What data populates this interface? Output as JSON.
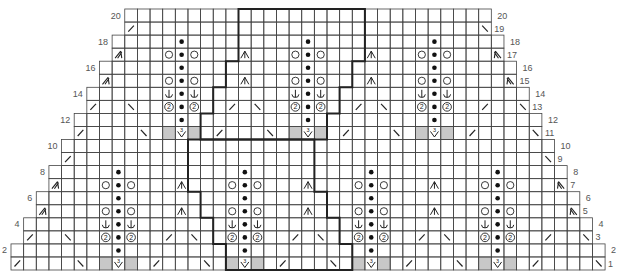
{
  "chart": {
    "columns": 47,
    "rows": 20,
    "shading_color": "#c8c8c8",
    "grid_color": "#444444",
    "outline_color": "#222222",
    "row_shape": "Each pair of rows (1-2, 3-4, ... 19-20) loses one stitch at each edge; rows 1-2 span columns 0-46, rows 19-20 span columns 9-37",
    "left_labels": [
      "2",
      "4",
      "6",
      "8",
      "10",
      "12",
      "14",
      "16",
      "18",
      "20"
    ],
    "right_labels": [
      "1",
      "2",
      "3",
      "4",
      "5",
      "6",
      "7",
      "8",
      "9",
      "10",
      "11",
      "12",
      "13",
      "14",
      "15",
      "16",
      "17",
      "18",
      "19",
      "20"
    ],
    "symbols": {
      "k2tog": "/",
      "ssk": "\\",
      "purl": "dot",
      "yo": "circle",
      "twist2": "circled-2",
      "anchor": "anchor",
      "dec3": "inverted-v-with-stem",
      "inc3": "v-with-3",
      "edge_dec_left": "double-slash-arrow-left",
      "edge_dec_right": "double-slash-arrow-right",
      "no_stitch": "gray"
    },
    "motif_lower_centers": [
      8,
      18,
      28,
      38
    ],
    "motif_upper_centers": [
      13,
      23,
      33
    ],
    "cells": [
      {
        "row": 1,
        "col": 0,
        "sym": "k2tog"
      },
      {
        "row": 1,
        "col": 5,
        "sym": "ssk"
      },
      {
        "row": 1,
        "col": 11,
        "sym": "k2tog"
      },
      {
        "row": 1,
        "col": 15,
        "sym": "ssk"
      },
      {
        "row": 1,
        "col": 21,
        "sym": "k2tog"
      },
      {
        "row": 1,
        "col": 25,
        "sym": "ssk"
      },
      {
        "row": 1,
        "col": 31,
        "sym": "k2tog"
      },
      {
        "row": 1,
        "col": 35,
        "sym": "ssk"
      },
      {
        "row": 1,
        "col": 41,
        "sym": "k2tog"
      },
      {
        "row": 1,
        "col": 46,
        "sym": "ssk"
      },
      {
        "row": 3,
        "col": 1,
        "sym": "k2tog"
      },
      {
        "row": 3,
        "col": 4,
        "sym": "ssk"
      },
      {
        "row": 3,
        "col": 12,
        "sym": "k2tog"
      },
      {
        "row": 3,
        "col": 14,
        "sym": "ssk"
      },
      {
        "row": 3,
        "col": 22,
        "sym": "k2tog"
      },
      {
        "row": 3,
        "col": 24,
        "sym": "ssk"
      },
      {
        "row": 3,
        "col": 32,
        "sym": "k2tog"
      },
      {
        "row": 3,
        "col": 34,
        "sym": "ssk"
      },
      {
        "row": 3,
        "col": 42,
        "sym": "k2tog"
      },
      {
        "row": 3,
        "col": 45,
        "sym": "ssk"
      },
      {
        "row": 5,
        "col": 2,
        "sym": "edge_dec_left"
      },
      {
        "row": 5,
        "col": 13,
        "sym": "dec3"
      },
      {
        "row": 5,
        "col": 23,
        "sym": "dec3"
      },
      {
        "row": 5,
        "col": 33,
        "sym": "dec3"
      },
      {
        "row": 5,
        "col": 44,
        "sym": "edge_dec_right"
      },
      {
        "row": 7,
        "col": 3,
        "sym": "edge_dec_left"
      },
      {
        "row": 7,
        "col": 13,
        "sym": "dec3"
      },
      {
        "row": 7,
        "col": 23,
        "sym": "dec3"
      },
      {
        "row": 7,
        "col": 33,
        "sym": "dec3"
      },
      {
        "row": 7,
        "col": 43,
        "sym": "edge_dec_right"
      },
      {
        "row": 9,
        "col": 4,
        "sym": "k2tog"
      },
      {
        "row": 9,
        "col": 42,
        "sym": "ssk"
      },
      {
        "row": 11,
        "col": 5,
        "sym": "k2tog"
      },
      {
        "row": 11,
        "col": 10,
        "sym": "ssk"
      },
      {
        "row": 11,
        "col": 16,
        "sym": "k2tog"
      },
      {
        "row": 11,
        "col": 20,
        "sym": "ssk"
      },
      {
        "row": 11,
        "col": 26,
        "sym": "k2tog"
      },
      {
        "row": 11,
        "col": 30,
        "sym": "ssk"
      },
      {
        "row": 11,
        "col": 36,
        "sym": "k2tog"
      },
      {
        "row": 11,
        "col": 41,
        "sym": "ssk"
      },
      {
        "row": 13,
        "col": 6,
        "sym": "k2tog"
      },
      {
        "row": 13,
        "col": 9,
        "sym": "ssk"
      },
      {
        "row": 13,
        "col": 17,
        "sym": "k2tog"
      },
      {
        "row": 13,
        "col": 19,
        "sym": "ssk"
      },
      {
        "row": 13,
        "col": 27,
        "sym": "k2tog"
      },
      {
        "row": 13,
        "col": 29,
        "sym": "ssk"
      },
      {
        "row": 13,
        "col": 37,
        "sym": "k2tog"
      },
      {
        "row": 13,
        "col": 40,
        "sym": "ssk"
      },
      {
        "row": 15,
        "col": 7,
        "sym": "edge_dec_left"
      },
      {
        "row": 15,
        "col": 18,
        "sym": "dec3"
      },
      {
        "row": 15,
        "col": 28,
        "sym": "dec3"
      },
      {
        "row": 15,
        "col": 39,
        "sym": "edge_dec_right"
      },
      {
        "row": 17,
        "col": 8,
        "sym": "edge_dec_left"
      },
      {
        "row": 17,
        "col": 18,
        "sym": "dec3"
      },
      {
        "row": 17,
        "col": 28,
        "sym": "dec3"
      },
      {
        "row": 17,
        "col": 38,
        "sym": "edge_dec_right"
      },
      {
        "row": 19,
        "col": 9,
        "sym": "k2tog"
      },
      {
        "row": 19,
        "col": 37,
        "sym": "ssk"
      }
    ],
    "motif_rows": [
      {
        "offset": 0,
        "left": "no_stitch",
        "center": "inc3",
        "right": "no_stitch"
      },
      {
        "offset": 1,
        "left": "",
        "center": "purl",
        "right": ""
      },
      {
        "offset": 2,
        "left": "twist2",
        "center": "purl",
        "right": "twist2"
      },
      {
        "offset": 3,
        "left": "anchor",
        "center": "purl",
        "right": "anchor"
      },
      {
        "offset": 4,
        "left": "yo",
        "center": "purl",
        "right": "yo"
      },
      {
        "offset": 5,
        "left": "",
        "center": "purl",
        "right": ""
      },
      {
        "offset": 6,
        "left": "yo",
        "center": "purl",
        "right": "yo"
      },
      {
        "offset": 7,
        "left": "",
        "center": "purl",
        "right": ""
      }
    ],
    "outline": {
      "description": "Bold repeat outline: upper block rows 11-20, lower block rows 1-10, each 10 stitches wide, stepping diagonally",
      "upper": [
        {
          "rows": [
            17,
            20
          ],
          "from_col": 18,
          "to_col": 28
        },
        {
          "rows": [
            15,
            16
          ],
          "from_col": 17,
          "to_col": 27
        },
        {
          "rows": [
            13,
            14
          ],
          "from_col": 16,
          "to_col": 26
        },
        {
          "rows": [
            11,
            12
          ],
          "from_col": 15,
          "to_col": 25
        }
      ],
      "lower": [
        {
          "rows": [
            7,
            10
          ],
          "from_col": 14,
          "to_col": 24
        },
        {
          "rows": [
            5,
            6
          ],
          "from_col": 15,
          "to_col": 25
        },
        {
          "rows": [
            3,
            4
          ],
          "from_col": 16,
          "to_col": 26
        },
        {
          "rows": [
            1,
            2
          ],
          "from_col": 17,
          "to_col": 27
        }
      ]
    }
  }
}
